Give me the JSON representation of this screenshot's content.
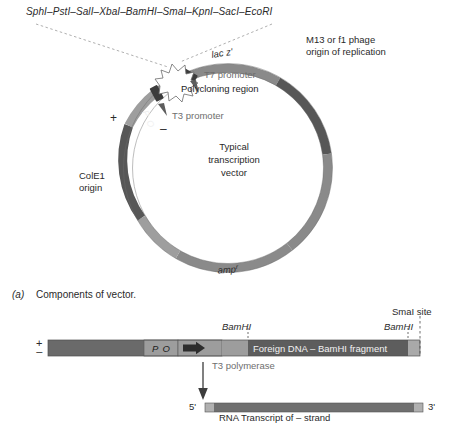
{
  "figure": {
    "polylinker_sites": "SphI–PstI–SalI–XbaI–BamHI–SmaI–KpnI–SacI–EcoRI",
    "panel_a": {
      "caption_label": "(a)",
      "caption_text": "Components of vector.",
      "center_line1": "Typical",
      "center_line2": "transcription",
      "center_line3": "vector",
      "labels": {
        "lac_z": "lac z'",
        "po": "P O",
        "amp": "amp",
        "amp_super": "r",
        "cole1_line1": "ColE1",
        "cole1_line2": "origin",
        "m13_line1": "M13 or f1 phage",
        "m13_line2": "origin of replication",
        "t7_promoter": "T7 promoter",
        "polycloning": "Polycloning region",
        "t3_promoter": "T3 promoter",
        "plus": "+",
        "minus": "–"
      }
    },
    "panel_b": {
      "strand_plus": "+",
      "strand_minus": "–",
      "po_box": "P O",
      "foreign_dna": "Foreign DNA – BamHI fragment",
      "bamhi_left": "BamHI",
      "bamhi_right": "BamHI",
      "smai_site": "SmaI site",
      "polymerase": "T3 polymerase",
      "five_prime": "5'",
      "three_prime": "3'",
      "transcript": "RNA Transcript of – strand"
    }
  },
  "colors": {
    "dark_gray": "#575757",
    "mid_gray": "#7d7d7d",
    "light_gray": "#a8a8a8",
    "pale_gray": "#c2c2c2",
    "label_gray": "#6e6e6e",
    "text": "#2a2a2a"
  }
}
